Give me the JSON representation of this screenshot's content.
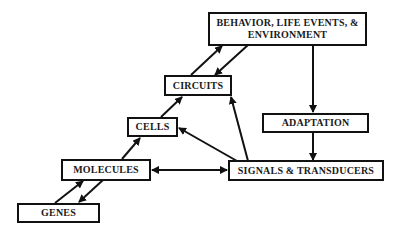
{
  "diagram": {
    "nodes": {
      "behavior": {
        "label": "BEHAVIOR, LIFE EVENTS, &\nENVIRONMENT"
      },
      "circuits": {
        "label": "CIRCUITS"
      },
      "cells": {
        "label": "CELLS"
      },
      "adaptation": {
        "label": "ADAPTATION"
      },
      "molecules": {
        "label": "MOLECULES"
      },
      "signals": {
        "label": "SIGNALS & TRANSDUCERS"
      },
      "genes": {
        "label": "GENES"
      }
    },
    "edges": [
      {
        "from": "GENES",
        "to": "MOLECULES"
      },
      {
        "from": "MOLECULES",
        "to": "GENES"
      },
      {
        "from": "MOLECULES",
        "to": "CELLS"
      },
      {
        "from": "CELLS",
        "to": "CIRCUITS"
      },
      {
        "from": "CIRCUITS",
        "to": "BEHAVIOR, LIFE EVENTS, & ENVIRONMENT"
      },
      {
        "from": "BEHAVIOR, LIFE EVENTS, & ENVIRONMENT",
        "to": "CIRCUITS"
      },
      {
        "from": "BEHAVIOR, LIFE EVENTS, & ENVIRONMENT",
        "to": "ADAPTATION"
      },
      {
        "from": "ADAPTATION",
        "to": "SIGNALS & TRANSDUCERS"
      },
      {
        "from": "SIGNALS & TRANSDUCERS",
        "to": "CELLS"
      },
      {
        "from": "SIGNALS & TRANSDUCERS",
        "to": "CIRCUITS"
      },
      {
        "from": "MOLECULES",
        "to": "SIGNALS & TRANSDUCERS",
        "bidirectional": true
      }
    ],
    "colors": {
      "stroke": "#111111",
      "background": "#ffffff"
    }
  }
}
